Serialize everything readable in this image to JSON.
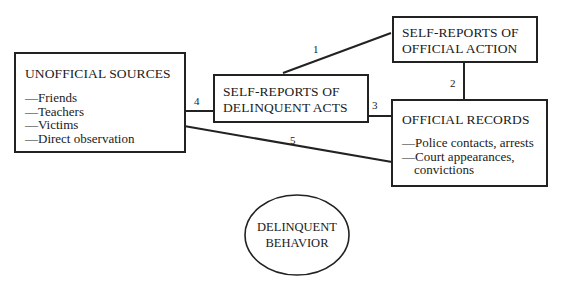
{
  "diagram": {
    "nodes": {
      "unofficial": {
        "title": "UNOFFICIAL SOURCES",
        "items": [
          "—Friends",
          "—Teachers",
          "—Victims",
          "—Direct observation"
        ]
      },
      "self_delinquent": {
        "title_line1": "SELF-REPORTS OF",
        "title_line2": "DELINQUENT ACTS"
      },
      "self_official": {
        "title_line1": "SELF-REPORTS OF",
        "title_line2": "OFFICIAL ACTION"
      },
      "official_records": {
        "title": "OFFICIAL RECORDS",
        "items": [
          "—Police contacts, arrests",
          "—Court appearances,",
          "  convictions"
        ]
      },
      "behavior": {
        "line1": "DELINQUENT",
        "line2": "BEHAVIOR"
      }
    },
    "edges": [
      {
        "label": "1",
        "from": "SELF-REPORTS OF DELINQUENT ACTS",
        "to": "SELF-REPORTS OF OFFICIAL ACTION"
      },
      {
        "label": "2",
        "from": "SELF-REPORTS OF OFFICIAL ACTION",
        "to": "OFFICIAL RECORDS"
      },
      {
        "label": "3",
        "from": "SELF-REPORTS OF DELINQUENT ACTS",
        "to": "OFFICIAL RECORDS"
      },
      {
        "label": "4",
        "from": "UNOFFICIAL SOURCES",
        "to": "SELF-REPORTS OF DELINQUENT ACTS"
      },
      {
        "label": "5",
        "from": "UNOFFICIAL SOURCES",
        "to": "OFFICIAL RECORDS"
      }
    ]
  }
}
